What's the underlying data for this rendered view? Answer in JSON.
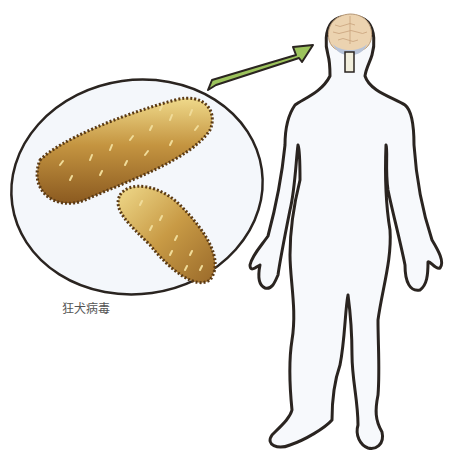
{
  "caption": {
    "label": "狂犬病毒"
  },
  "figure": {
    "elements": [
      "magnified-virus-ellipse",
      "arrow-to-brain",
      "human-body-outline",
      "brain"
    ]
  },
  "colors": {
    "outline": "#2a2420",
    "virus_body": "#b8862e",
    "virus_dark": "#8a5a1c",
    "virus_light": "#e8cf7a",
    "spike": "#f0dc9a",
    "ellipse_fill": "#f4f7fb",
    "body_fill": "#f7f9fc",
    "arrow": "#9cc35c",
    "brain": "#ecd3b0",
    "brainstem": "#f1eedc",
    "cerebellum": "#b7c3d8"
  }
}
